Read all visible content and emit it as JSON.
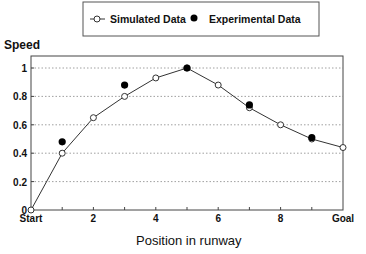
{
  "chart_data": {
    "type": "line",
    "title": "",
    "xlabel": "Position in runway",
    "ylabel": "Speed",
    "xlim": [
      0,
      10
    ],
    "ylim": [
      0,
      1.1
    ],
    "x_ticks": [
      0,
      1,
      2,
      3,
      4,
      5,
      6,
      7,
      8,
      9,
      10
    ],
    "x_tick_labels": [
      "Start",
      "",
      "2",
      "",
      "4",
      "",
      "6",
      "",
      "8",
      "",
      "Goal"
    ],
    "y_ticks": [
      0,
      0.2,
      0.4,
      0.6,
      0.8,
      1
    ],
    "y_tick_labels": [
      "0",
      "0.2",
      "0.4",
      "0.6",
      "0.8",
      "1"
    ],
    "grid": "horizontal dotted",
    "legend_position": "top",
    "series": [
      {
        "name": "Simulated Data",
        "style": "line with open circles",
        "x": [
          0,
          1,
          2,
          3,
          4,
          5,
          6,
          7,
          8,
          9,
          10
        ],
        "values": [
          0,
          0.4,
          0.65,
          0.8,
          0.93,
          1.0,
          0.88,
          0.72,
          0.6,
          0.5,
          0.44
        ]
      },
      {
        "name": "Experimental Data",
        "style": "filled circles",
        "x": [
          1,
          3,
          5,
          7,
          9
        ],
        "values": [
          0.48,
          0.88,
          1.0,
          0.74,
          0.51
        ]
      }
    ]
  },
  "legend": {
    "simulated_label": "Simulated Data",
    "experimental_label": "Experimental Data"
  },
  "axes": {
    "ylabel": "Speed",
    "xlabel": "Position in runway"
  },
  "colors": {
    "line": "#333333",
    "grid": "#888888",
    "marker_fill_experimental": "#000000",
    "marker_fill_simulated": "#ffffff"
  }
}
